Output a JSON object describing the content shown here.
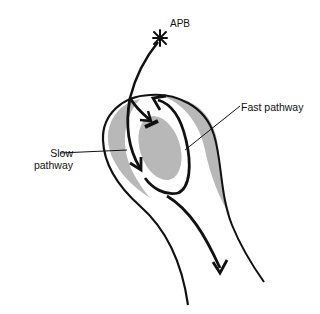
{
  "diagram": {
    "type": "anatomical schematic",
    "labels": {
      "apb": "APB",
      "fast_pathway": "Fast pathway",
      "slow_pathway": "Slow pathway"
    },
    "colors": {
      "outline": "#111111",
      "shaded_tissue": "#b8b8b8",
      "background": "#ffffff"
    },
    "elements": [
      {
        "name": "premature beat origin",
        "symbol": "asterisk"
      },
      {
        "name": "slow pathway arrow",
        "direction": "down"
      },
      {
        "name": "fast pathway arrow",
        "direction": "up (retrograde)"
      },
      {
        "name": "block mark",
        "symbol": "bar"
      },
      {
        "name": "exit arrow",
        "direction": "down"
      }
    ]
  }
}
